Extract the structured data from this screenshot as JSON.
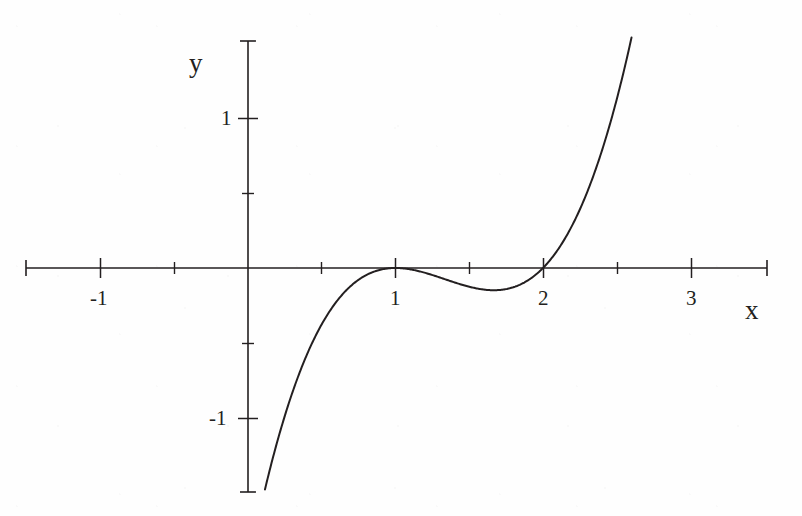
{
  "figure": {
    "title": "",
    "background_color": "#fefefe",
    "ink_color": "#231f20",
    "width": 802,
    "height": 516
  },
  "axes": {
    "x_axis_label": "x",
    "y_axis_label": "y",
    "x_tick_labels": [
      "-1",
      "1",
      "2",
      "3"
    ],
    "y_tick_labels": [
      "1",
      "-1"
    ]
  },
  "chart_data": {
    "type": "line",
    "title": "",
    "xlabel": "x",
    "ylabel": "y",
    "grid": false,
    "legend": "none",
    "equation": "y = (x - 1)^2 (x - 2)",
    "xlim": [
      -1.5,
      3.5
    ],
    "ylim": [
      -1.52,
      1.52
    ],
    "x_ticks": [
      -1,
      1,
      2,
      3
    ],
    "x_tick_labels": [
      "-1",
      "1",
      "2",
      "3"
    ],
    "x_minor_ticks": [
      -0.5,
      0.5,
      1.5,
      2.5
    ],
    "y_ticks": [
      1,
      -1
    ],
    "y_tick_labels": [
      "1",
      "-1"
    ],
    "y_minor_ticks": [
      0.5,
      -0.5
    ],
    "roots": [
      1,
      2
    ],
    "double_root": 1,
    "local_minimum": {
      "x": 1.667,
      "y": -0.148
    },
    "curve_domain": [
      0.115,
      2.6
    ],
    "x": [
      0.115,
      0.2,
      0.3,
      0.4,
      0.5,
      0.6,
      0.7,
      0.8,
      0.9,
      1.0,
      1.1,
      1.2,
      1.3,
      1.4,
      1.5,
      1.6,
      1.667,
      1.7,
      1.8,
      1.9,
      2.0,
      2.1,
      2.2,
      2.3,
      2.4,
      2.5,
      2.6
    ],
    "y": [
      -1.474,
      -1.152,
      -0.833,
      -0.576,
      -0.375,
      -0.224,
      -0.117,
      -0.048,
      -0.011,
      0.0,
      -0.009,
      -0.032,
      -0.063,
      -0.096,
      -0.125,
      -0.144,
      -0.148,
      -0.147,
      -0.128,
      -0.081,
      0.0,
      0.121,
      0.288,
      0.507,
      0.784,
      1.125,
      1.536
    ]
  },
  "annotations": {
    "origin_pixel": {
      "x": 248,
      "y": 268
    },
    "unit_px_x": 147.5,
    "unit_px_y": 150
  }
}
